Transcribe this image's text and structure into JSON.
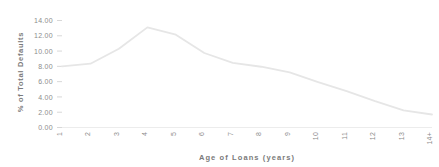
{
  "chart_data": {
    "type": "line",
    "title": "",
    "xlabel": "Age of Loans (years)",
    "ylabel": "% of Total Defaults",
    "categories": [
      "1",
      "2",
      "3",
      "4",
      "5",
      "6",
      "7",
      "8",
      "9",
      "10",
      "11",
      "12",
      "13",
      "14+"
    ],
    "values": [
      8.0,
      8.35,
      10.3,
      13.1,
      12.15,
      9.75,
      8.45,
      7.95,
      7.2,
      5.95,
      4.75,
      3.45,
      2.25,
      1.7
    ],
    "series": [
      {
        "name": "% of Total Defaults",
        "values": [
          8.0,
          8.35,
          10.3,
          13.1,
          12.15,
          9.75,
          8.45,
          7.95,
          7.2,
          5.95,
          4.75,
          3.45,
          2.25,
          1.7
        ]
      }
    ],
    "ylim": [
      0,
      14
    ],
    "xlim": [
      "1",
      "14+"
    ],
    "ytick_labels": [
      "0.00",
      "2.00",
      "4.00",
      "6.00",
      "8.00",
      "10.00",
      "12.00",
      "14.00"
    ],
    "ytick_values": [
      0,
      2,
      4,
      6,
      8,
      10,
      12,
      14
    ],
    "xtick_labels": [
      "1",
      "2",
      "3",
      "4",
      "5",
      "6",
      "7",
      "8",
      "9",
      "10",
      "11",
      "12",
      "13",
      "14+"
    ],
    "grid": false,
    "legend": "none",
    "line_color": "#e6e6e6",
    "text_color": "#8c8c8c",
    "background_color": "#ffffff"
  }
}
